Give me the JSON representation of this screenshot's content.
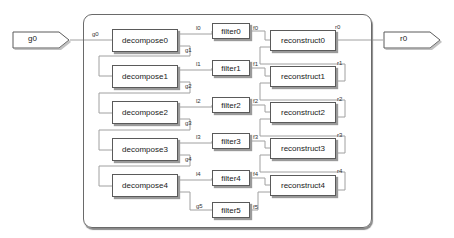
{
  "diagram": {
    "type": "block-diagram",
    "input_port": {
      "label": "g0"
    },
    "output_port": {
      "label": "r0"
    },
    "subsystem_input_signal": "g0",
    "decompose_blocks": [
      {
        "label": "decompose0"
      },
      {
        "label": "decompose1"
      },
      {
        "label": "decompose2"
      },
      {
        "label": "decompose3"
      },
      {
        "label": "decompose4"
      }
    ],
    "filter_blocks": [
      {
        "label": "filter0"
      },
      {
        "label": "filter1"
      },
      {
        "label": "filter2"
      },
      {
        "label": "filter3"
      },
      {
        "label": "filter4"
      },
      {
        "label": "filter5"
      }
    ],
    "reconstruct_blocks": [
      {
        "label": "reconstruct0"
      },
      {
        "label": "reconstruct1"
      },
      {
        "label": "reconstruct2"
      },
      {
        "label": "reconstruct3"
      },
      {
        "label": "reconstruct4"
      }
    ],
    "signals": {
      "l": [
        "l0",
        "l1",
        "l2",
        "l3",
        "l4"
      ],
      "g": [
        "g1",
        "g2",
        "g3",
        "g4",
        "g5"
      ],
      "f": [
        "f0",
        "f1",
        "f2",
        "f3",
        "f4",
        "f5"
      ],
      "r": [
        "r0",
        "r1",
        "r2",
        "r3",
        "r4"
      ]
    },
    "colors": {
      "border": "#5a5a5a",
      "wire": "#9a9a9a",
      "shadow": "#9a9a9a"
    }
  }
}
